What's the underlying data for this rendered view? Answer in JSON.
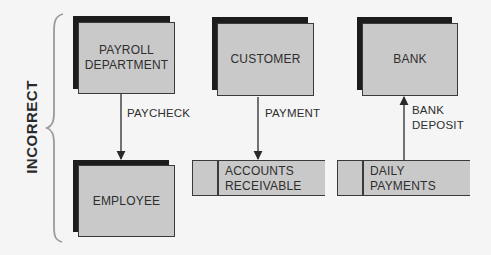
{
  "diagram": {
    "side_label": "INCORRECT",
    "entities": [
      {
        "id": "payroll",
        "line1": "PAYROLL",
        "line2": "DEPARTMENT"
      },
      {
        "id": "customer",
        "line1": "CUSTOMER"
      },
      {
        "id": "bank",
        "line1": "BANK"
      },
      {
        "id": "employee",
        "line1": "EMPLOYEE"
      }
    ],
    "data_stores": [
      {
        "id": "accounts-receivable",
        "line1": "ACCOUNTS",
        "line2": "RECEIVABLE"
      },
      {
        "id": "daily-payments",
        "line1": "DAILY",
        "line2": "PAYMENTS"
      }
    ],
    "flows": [
      {
        "from": "PAYROLL DEPARTMENT",
        "to": "EMPLOYEE",
        "line1": "PAYCHECK"
      },
      {
        "from": "CUSTOMER",
        "to": "ACCOUNTS RECEIVABLE",
        "line1": "PAYMENT"
      },
      {
        "from": "DAILY PAYMENTS",
        "to": "BANK",
        "line1": "BANK",
        "line2": "DEPOSIT"
      }
    ]
  },
  "colors": {
    "background": "#f5f5f5",
    "box_fill": "#c9c9c9",
    "shadow": "#1c1c1c",
    "line": "#2a2a2a",
    "brace": "#9a9a9a"
  }
}
